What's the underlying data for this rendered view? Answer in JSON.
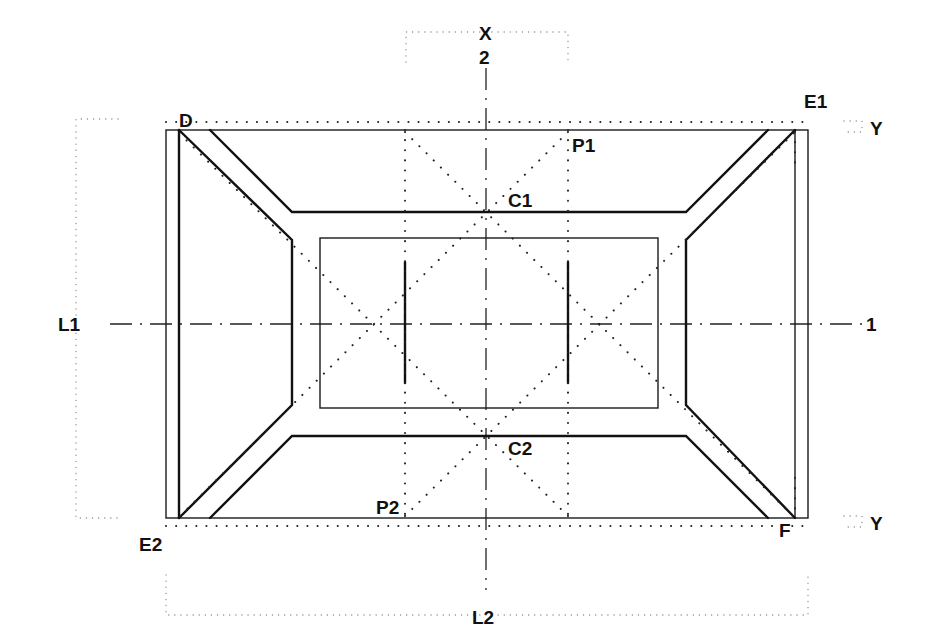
{
  "figure": {
    "type": "technical-drawing"
  },
  "labels": {
    "axis_x": "X",
    "axis_2": "2",
    "axis_1": "1",
    "corner_D": "D",
    "corner_E1": "E1",
    "corner_E2": "E2",
    "corner_F": "F",
    "point_P1": "P1",
    "point_P2": "P2",
    "point_C1": "C1",
    "point_C2": "C2",
    "dim_L1": "L1",
    "dim_L2": "L2",
    "offset_Y_top": "Y",
    "offset_Y_bottom": "Y"
  },
  "colors": {
    "ink": "#111111",
    "background": "#ffffff",
    "construction": "#888888"
  }
}
